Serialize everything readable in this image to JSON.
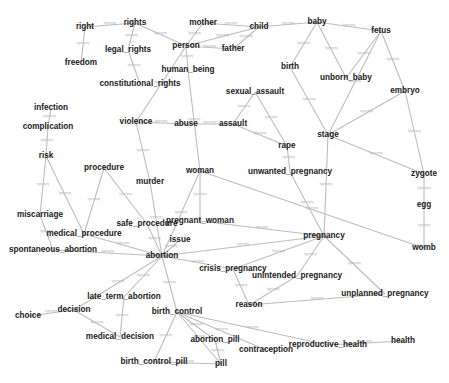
{
  "graph": {
    "edge_label_text": "hypernymy",
    "colors": {
      "node_text": "#1a1a1a",
      "edge": "#bdbdbd",
      "edge_label": "#b0b0b0",
      "background": "#ffffff"
    },
    "nodes": [
      {
        "id": "right",
        "label": "right",
        "x": 85,
        "y": 27
      },
      {
        "id": "rights",
        "label": "rights",
        "x": 135,
        "y": 23
      },
      {
        "id": "mother",
        "label": "mother",
        "x": 203,
        "y": 23
      },
      {
        "id": "child",
        "label": "child",
        "x": 259,
        "y": 27
      },
      {
        "id": "baby",
        "label": "baby",
        "x": 317,
        "y": 22
      },
      {
        "id": "fetus",
        "label": "fetus",
        "x": 381,
        "y": 31
      },
      {
        "id": "legal_rights",
        "label": "legal_rights",
        "x": 128,
        "y": 50
      },
      {
        "id": "person",
        "label": "person",
        "x": 186,
        "y": 46
      },
      {
        "id": "father",
        "label": "father",
        "x": 233,
        "y": 49
      },
      {
        "id": "freedom",
        "label": "freedom",
        "x": 81,
        "y": 63
      },
      {
        "id": "constitutional_rights",
        "label": "constitutional_rights",
        "x": 140,
        "y": 84
      },
      {
        "id": "human_being",
        "label": "human_being",
        "x": 188,
        "y": 70
      },
      {
        "id": "birth",
        "label": "birth",
        "x": 290,
        "y": 67
      },
      {
        "id": "unborn_baby",
        "label": "unborn_baby",
        "x": 346,
        "y": 78
      },
      {
        "id": "embryo",
        "label": "embryo",
        "x": 405,
        "y": 91
      },
      {
        "id": "infection",
        "label": "infection",
        "x": 51,
        "y": 108
      },
      {
        "id": "sexual_assault",
        "label": "sexual_assault",
        "x": 255,
        "y": 92
      },
      {
        "id": "complication",
        "label": "complication",
        "x": 48,
        "y": 127
      },
      {
        "id": "violence",
        "label": "violence",
        "x": 136,
        "y": 122
      },
      {
        "id": "abuse",
        "label": "abuse",
        "x": 186,
        "y": 124
      },
      {
        "id": "assault",
        "label": "assault",
        "x": 233,
        "y": 124
      },
      {
        "id": "rape",
        "label": "rape",
        "x": 287,
        "y": 146
      },
      {
        "id": "stage",
        "label": "stage",
        "x": 328,
        "y": 135
      },
      {
        "id": "risk",
        "label": "risk",
        "x": 46,
        "y": 156
      },
      {
        "id": "procedure",
        "label": "procedure",
        "x": 104,
        "y": 168
      },
      {
        "id": "murder",
        "label": "murder",
        "x": 150,
        "y": 182
      },
      {
        "id": "woman",
        "label": "woman",
        "x": 200,
        "y": 171
      },
      {
        "id": "unwanted_pregnancy",
        "label": "unwanted_pregnancy",
        "x": 290,
        "y": 172
      },
      {
        "id": "zygote",
        "label": "zygote",
        "x": 424,
        "y": 174
      },
      {
        "id": "egg",
        "label": "egg",
        "x": 424,
        "y": 205
      },
      {
        "id": "miscarriage",
        "label": "miscarriage",
        "x": 40,
        "y": 215
      },
      {
        "id": "pregnant_woman",
        "label": "pregnant_woman",
        "x": 200,
        "y": 221
      },
      {
        "id": "safe_procedure",
        "label": "safe_procedure",
        "x": 147,
        "y": 224
      },
      {
        "id": "medical_procedure",
        "label": "medical_procedure",
        "x": 84,
        "y": 234
      },
      {
        "id": "issue",
        "label": "issue",
        "x": 180,
        "y": 240
      },
      {
        "id": "pregnancy",
        "label": "pregnancy",
        "x": 324,
        "y": 236
      },
      {
        "id": "womb",
        "label": "womb",
        "x": 424,
        "y": 248
      },
      {
        "id": "spontaneous_abortion",
        "label": "spontaneous_abortion",
        "x": 53,
        "y": 250
      },
      {
        "id": "abortion",
        "label": "abortion",
        "x": 162,
        "y": 256
      },
      {
        "id": "crisis_pregnancy",
        "label": "crisis_pregnancy",
        "x": 233,
        "y": 269
      },
      {
        "id": "unintended_pregnancy",
        "label": "unintended_pregnancy",
        "x": 297,
        "y": 276
      },
      {
        "id": "unplanned_pregnancy",
        "label": "unplanned_pregnancy",
        "x": 385,
        "y": 294
      },
      {
        "id": "reason",
        "label": "reason",
        "x": 249,
        "y": 305
      },
      {
        "id": "late_term_abortion",
        "label": "late_term_abortion",
        "x": 124,
        "y": 297
      },
      {
        "id": "birth_control",
        "label": "birth_control",
        "x": 177,
        "y": 312
      },
      {
        "id": "decision",
        "label": "decision",
        "x": 74,
        "y": 310
      },
      {
        "id": "choice",
        "label": "choice",
        "x": 28,
        "y": 316
      },
      {
        "id": "medical_decision",
        "label": "medical_decision",
        "x": 120,
        "y": 337
      },
      {
        "id": "abortion_pill",
        "label": "abortion_pill",
        "x": 215,
        "y": 340
      },
      {
        "id": "contraception",
        "label": "contraception",
        "x": 266,
        "y": 350
      },
      {
        "id": "reproductive_health",
        "label": "reproductive_health",
        "x": 328,
        "y": 345
      },
      {
        "id": "health",
        "label": "health",
        "x": 403,
        "y": 341
      },
      {
        "id": "birth_control_pill",
        "label": "birth_control_pill",
        "x": 154,
        "y": 362
      },
      {
        "id": "pill",
        "label": "pill",
        "x": 221,
        "y": 364
      }
    ],
    "edges": [
      [
        "right",
        "rights"
      ],
      [
        "right",
        "freedom"
      ],
      [
        "rights",
        "legal_rights"
      ],
      [
        "legal_rights",
        "constitutional_rights"
      ],
      [
        "rights",
        "person"
      ],
      [
        "mother",
        "child"
      ],
      [
        "mother",
        "person"
      ],
      [
        "person",
        "child"
      ],
      [
        "person",
        "father"
      ],
      [
        "father",
        "child"
      ],
      [
        "child",
        "baby"
      ],
      [
        "baby",
        "fetus"
      ],
      [
        "baby",
        "birth"
      ],
      [
        "baby",
        "unborn_baby"
      ],
      [
        "fetus",
        "unborn_baby"
      ],
      [
        "fetus",
        "stage"
      ],
      [
        "fetus",
        "embryo"
      ],
      [
        "birth",
        "stage"
      ],
      [
        "embryo",
        "stage"
      ],
      [
        "embryo",
        "zygote"
      ],
      [
        "stage",
        "zygote"
      ],
      [
        "zygote",
        "egg"
      ],
      [
        "egg",
        "womb"
      ],
      [
        "person",
        "human_being"
      ],
      [
        "person",
        "violence"
      ],
      [
        "human_being",
        "woman"
      ],
      [
        "violence",
        "abuse"
      ],
      [
        "abuse",
        "assault"
      ],
      [
        "assault",
        "rape"
      ],
      [
        "sexual_assault",
        "assault"
      ],
      [
        "sexual_assault",
        "rape"
      ],
      [
        "rape",
        "unwanted_pregnancy"
      ],
      [
        "unwanted_pregnancy",
        "pregnancy"
      ],
      [
        "stage",
        "pregnancy"
      ],
      [
        "woman",
        "womb"
      ],
      [
        "woman",
        "pregnant_woman"
      ],
      [
        "woman",
        "abortion"
      ],
      [
        "pregnant_woman",
        "pregnancy"
      ],
      [
        "pregnancy",
        "abortion"
      ],
      [
        "pregnancy",
        "crisis_pregnancy"
      ],
      [
        "pregnancy",
        "unintended_pregnancy"
      ],
      [
        "pregnancy",
        "unplanned_pregnancy"
      ],
      [
        "crisis_pregnancy",
        "reason"
      ],
      [
        "unintended_pregnancy",
        "reason"
      ],
      [
        "reason",
        "unplanned_pregnancy"
      ],
      [
        "infection",
        "complication"
      ],
      [
        "complication",
        "risk"
      ],
      [
        "risk",
        "miscarriage"
      ],
      [
        "risk",
        "medical_procedure"
      ],
      [
        "miscarriage",
        "spontaneous_abortion"
      ],
      [
        "procedure",
        "medical_procedure"
      ],
      [
        "procedure",
        "safe_procedure"
      ],
      [
        "violence",
        "murder"
      ],
      [
        "murder",
        "abortion"
      ],
      [
        "safe_procedure",
        "abortion"
      ],
      [
        "medical_procedure",
        "abortion"
      ],
      [
        "spontaneous_abortion",
        "abortion"
      ],
      [
        "issue",
        "abortion"
      ],
      [
        "abortion",
        "crisis_pregnancy"
      ],
      [
        "abortion",
        "decision"
      ],
      [
        "abortion",
        "late_term_abortion"
      ],
      [
        "abortion",
        "birth_control"
      ],
      [
        "late_term_abortion",
        "medical_decision"
      ],
      [
        "decision",
        "choice"
      ],
      [
        "decision",
        "medical_decision"
      ],
      [
        "birth_control",
        "birth_control_pill"
      ],
      [
        "birth_control",
        "abortion_pill"
      ],
      [
        "birth_control",
        "pill"
      ],
      [
        "birth_control",
        "contraception"
      ],
      [
        "birth_control",
        "reproductive_health"
      ],
      [
        "reproductive_health",
        "health"
      ],
      [
        "birth_control_pill",
        "pill"
      ],
      [
        "abortion_pill",
        "pill"
      ]
    ]
  }
}
